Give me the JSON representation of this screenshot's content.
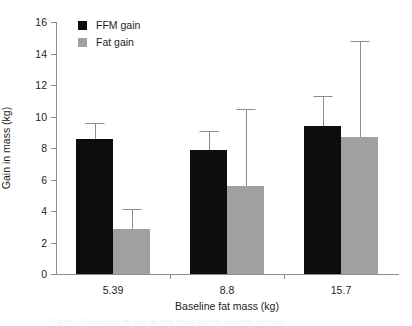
{
  "chart_data": {
    "type": "bar",
    "title": "",
    "subtitle": "",
    "xlabel": "Baseline fat mass (kg)",
    "ylabel": "Gain in mass (kg)",
    "categories": [
      "5.39",
      "8.8",
      "15.7"
    ],
    "ylim": [
      0,
      16
    ],
    "yticks": [
      0,
      2,
      4,
      6,
      8,
      10,
      12,
      14,
      16
    ],
    "ytick_labels": [
      "0",
      "2",
      "4",
      "6",
      "8",
      "10",
      "12",
      "14",
      "16"
    ],
    "grid": false,
    "legend_position": "top-left",
    "series": [
      {
        "name": "FFM gain",
        "color": "#0d0d0d",
        "values": [
          8.6,
          7.9,
          9.4
        ],
        "error_upper": [
          9.6,
          9.1,
          11.3
        ]
      },
      {
        "name": "Fat gain",
        "color": "#a0a0a0",
        "values": [
          2.85,
          5.6,
          8.7
        ],
        "error_upper": [
          4.1,
          10.5,
          14.8
        ]
      }
    ],
    "annotations": []
  },
  "legend": {
    "items": [
      {
        "label": "FFM gain",
        "color": "#0d0d0d",
        "swatch": "filled-square-black"
      },
      {
        "label": "Fat gain",
        "color": "#a0a0a0",
        "swatch": "filled-square-gray"
      }
    ]
  },
  "caption": {
    "text": "Figure 1  Relation of fat and fat-free mass gain to baseline fat mass"
  },
  "colors": {
    "ffm": "#0d0d0d",
    "fat": "#a0a0a0",
    "axis": "#8d8d8d",
    "text": "#231f20",
    "background": "#ffffff"
  }
}
